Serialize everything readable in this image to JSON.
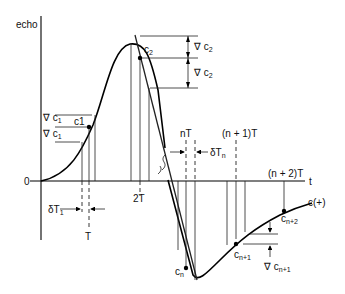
{
  "diagram": {
    "y_axis_label": "echo",
    "x_axis_label": "t",
    "origin_label": "0",
    "curve_label": "c(+)",
    "points": {
      "c1": "c1",
      "c2": "c",
      "c2_sub": "2",
      "cn": "c",
      "cn_sub": "n",
      "cn1": "c",
      "cn1_sub": "n+1",
      "cn2": "c",
      "cn2_sub": "n+2"
    },
    "deltas": {
      "grad_c1_a": "∇ c",
      "grad_c1_a_sub": "1",
      "grad_c1_b": "∇ c",
      "grad_c1_b_sub": "1",
      "grad_c2_a": "∇ c",
      "grad_c2_a_sub": "2",
      "grad_c2_b": "∇ c",
      "grad_c2_b_sub": "2",
      "grad_cn1": "∇ c",
      "grad_cn1_sub": "n+1"
    },
    "time_labels": {
      "T": "T",
      "twoT": "2T",
      "nT": "nT",
      "n1T": "(n + 1)T",
      "n2T": "(n + 2)T",
      "dT1": "δT",
      "dT1_sub": "1",
      "dTn": "δT",
      "dTn_sub": "n"
    }
  }
}
